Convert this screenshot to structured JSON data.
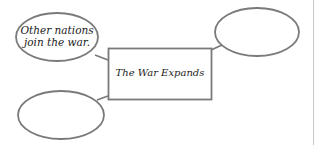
{
  "diagram": {
    "type": "web organizer",
    "center": {
      "label": "The War Expands"
    },
    "nodes": [
      {
        "id": "top-left",
        "text_line1": "Other nations",
        "text_line2": "join the war."
      },
      {
        "id": "top-right",
        "text_line1": "",
        "text_line2": ""
      },
      {
        "id": "bottom-left",
        "text_line1": "",
        "text_line2": ""
      }
    ],
    "colors": {
      "stroke": "#7a7a7a",
      "text": "#222222",
      "background": "#ffffff",
      "margin_line": "#c8c8c8"
    }
  }
}
